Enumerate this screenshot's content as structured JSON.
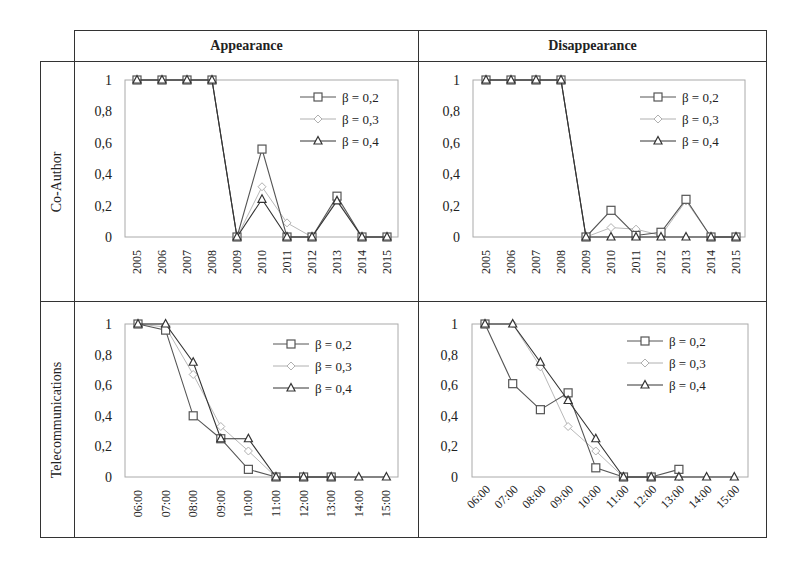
{
  "headers": {
    "col1": "Appearance",
    "col2": "Disappearance"
  },
  "row_labels": {
    "row1": "Co-Author",
    "row2": "Telecommunications"
  },
  "legend": [
    "β = 0,2",
    "β = 0,3",
    "β = 0,4"
  ],
  "series_style": {
    "b02": {
      "marker": "square",
      "color": "#555555"
    },
    "b03": {
      "marker": "diamond",
      "color": "#b0b0b0"
    },
    "b04": {
      "marker": "triangle",
      "color": "#333333"
    }
  },
  "chart_data": [
    {
      "type": "line",
      "title": "Appearance",
      "row": "Co-Author",
      "categories": [
        "2005",
        "2006",
        "2007",
        "2008",
        "2009",
        "2010",
        "2011",
        "2012",
        "2013",
        "2014",
        "2015"
      ],
      "yticks": [
        "0",
        "0,2",
        "0,4",
        "0,6",
        "0,8",
        "1"
      ],
      "ylim": [
        0,
        1
      ],
      "xlabel": "",
      "ylabel": "",
      "legend_position": "upper right",
      "x_label_rotation": -90,
      "series": [
        {
          "name": "β = 0,2",
          "values": [
            1,
            1,
            1,
            1,
            0,
            0.56,
            0,
            0,
            0.26,
            0,
            0
          ]
        },
        {
          "name": "β = 0,3",
          "values": [
            1,
            1,
            1,
            1,
            0,
            0.32,
            0.09,
            0,
            0.24,
            0,
            0
          ]
        },
        {
          "name": "β = 0,4",
          "values": [
            1,
            1,
            1,
            1,
            0,
            0.24,
            0,
            0,
            0.23,
            0,
            0
          ]
        }
      ]
    },
    {
      "type": "line",
      "title": "Disappearance",
      "row": "Co-Author",
      "categories": [
        "2005",
        "2006",
        "2007",
        "2008",
        "2009",
        "2010",
        "2011",
        "2012",
        "2013",
        "2014",
        "2015"
      ],
      "yticks": [
        "0",
        "0,2",
        "0,4",
        "0,6",
        "0,8",
        "1"
      ],
      "ylim": [
        0,
        1
      ],
      "xlabel": "",
      "ylabel": "",
      "legend_position": "upper right",
      "x_label_rotation": -90,
      "series": [
        {
          "name": "β = 0,2",
          "values": [
            1,
            1,
            1,
            1,
            0,
            0.17,
            0.01,
            0.03,
            0.24,
            0,
            0
          ]
        },
        {
          "name": "β = 0,3",
          "values": [
            1,
            1,
            1,
            1,
            0,
            0.06,
            0.05,
            0.01,
            0.23,
            0,
            0
          ]
        },
        {
          "name": "β = 0,4",
          "values": [
            1,
            1,
            1,
            1,
            0,
            0,
            0,
            0,
            0,
            0,
            0
          ]
        }
      ]
    },
    {
      "type": "line",
      "title": "Appearance",
      "row": "Telecommunications",
      "categories": [
        "06:00",
        "07:00",
        "08:00",
        "09:00",
        "10:00",
        "11:00",
        "12:00",
        "13:00",
        "14:00",
        "15:00"
      ],
      "yticks": [
        "0",
        "0,2",
        "0,4",
        "0,6",
        "0,8",
        "1"
      ],
      "ylim": [
        0,
        1
      ],
      "xlabel": "",
      "ylabel": "",
      "legend_position": "upper right",
      "x_label_rotation": -90,
      "series": [
        {
          "name": "β = 0,2",
          "values": [
            1,
            0.96,
            0.4,
            0.25,
            0.05,
            0,
            0,
            0,
            null,
            null
          ]
        },
        {
          "name": "β = 0,3",
          "values": [
            1,
            0.98,
            0.67,
            0.33,
            0.17,
            0,
            0,
            0,
            null,
            null
          ]
        },
        {
          "name": "β = 0,4",
          "values": [
            1,
            1,
            0.75,
            0.25,
            0.25,
            0,
            0,
            0,
            0,
            0
          ]
        }
      ]
    },
    {
      "type": "line",
      "title": "Disappearance",
      "row": "Telecommunications",
      "categories": [
        "06:00",
        "07:00",
        "08:00",
        "09:00",
        "10:00",
        "11:00",
        "12:00",
        "13:00",
        "14:00",
        "15:00"
      ],
      "yticks": [
        "0",
        "0,2",
        "0,4",
        "0,6",
        "0,8",
        "1"
      ],
      "ylim": [
        0,
        1
      ],
      "xlabel": "",
      "ylabel": "",
      "legend_position": "upper right",
      "x_label_rotation": -45,
      "series": [
        {
          "name": "β = 0,2",
          "values": [
            1,
            0.61,
            0.44,
            0.55,
            0.06,
            0,
            0,
            0.05,
            null,
            null
          ]
        },
        {
          "name": "β = 0,3",
          "values": [
            1,
            1,
            0.72,
            0.33,
            0.17,
            0,
            0,
            0,
            null,
            null
          ]
        },
        {
          "name": "β = 0,4",
          "values": [
            1,
            1,
            0.75,
            0.5,
            0.25,
            0,
            0,
            0,
            0,
            0
          ]
        }
      ]
    }
  ]
}
